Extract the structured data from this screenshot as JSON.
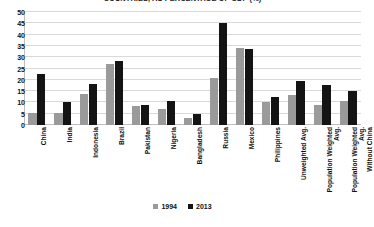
{
  "chart_data": {
    "type": "bar",
    "title": "COUNTRIES, AS PERCENTAGE OF GDP (%)",
    "xlabel": "",
    "ylabel": "",
    "ylim": [
      0,
      50
    ],
    "yticks": [
      0,
      5,
      10,
      15,
      20,
      25,
      30,
      35,
      40,
      45,
      50
    ],
    "grid": true,
    "legend_position": "bottom",
    "categories": [
      "China",
      "India",
      "Indonesia",
      "Brazil",
      "Pakistan",
      "Nigeria",
      "Bangladesh",
      "Russia",
      "Mexico",
      "Philippines",
      "Unweighted Avg.",
      "Population Weighted Avg.",
      "Population Weighted Avg.\nWithout China"
    ],
    "series": [
      {
        "name": "1994",
        "color": "#9a9a9a",
        "values": [
          5.5,
          5.2,
          13.8,
          26.8,
          8.3,
          7.3,
          3.3,
          20.8,
          34.0,
          10.0,
          13.5,
          8.8,
          10.5
        ]
      },
      {
        "name": "2013",
        "color": "#141414",
        "values": [
          22.5,
          10.3,
          18.0,
          28.3,
          9.0,
          10.5,
          5.0,
          45.0,
          33.5,
          12.2,
          19.4,
          17.7,
          15.2
        ]
      }
    ]
  },
  "colors": {
    "series_1994": "#9a9a9a",
    "series_2013": "#141414",
    "gridline": "#d9d9d9",
    "axis": "#bfbfbf",
    "text": "#111111",
    "background": "#ffffff"
  }
}
